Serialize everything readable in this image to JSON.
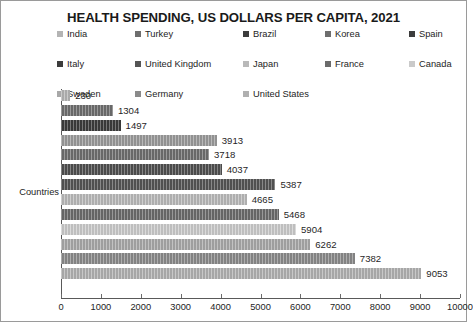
{
  "chart_data": {
    "type": "bar",
    "orientation": "horizontal",
    "title": "HEALTH SPENDING, US DOLLARS PER CAPITA, 2021",
    "xlabel": "",
    "ylabel": "Countries",
    "xlim": [
      0,
      10000
    ],
    "grid": false,
    "legend_position": "top",
    "xticks": [
      "0",
      "1000",
      "2000",
      "3000",
      "4000",
      "5000",
      "6000",
      "7000",
      "8000",
      "9000",
      "10000"
    ],
    "xtick_values": [
      0,
      1000,
      2000,
      3000,
      4000,
      5000,
      6000,
      7000,
      8000,
      9000,
      10000
    ],
    "categories": [
      "India",
      "Turkey",
      "Brazil",
      "Korea",
      "Spain",
      "Italy",
      "United Kingdom",
      "Japan",
      "France",
      "Canada",
      "Sweden",
      "Germany",
      "United States"
    ],
    "values": [
      230,
      1304,
      1497,
      3913,
      3718,
      4037,
      5387,
      4665,
      5468,
      5904,
      6262,
      7382,
      9053
    ],
    "bar_colors": [
      "#b4b4b4",
      "#6e6e6e",
      "#3c3c3c",
      "#9a9a9a",
      "#6e6e6e",
      "#4f4f4f",
      "#555555",
      "#b9b9b9",
      "#6b6b6b",
      "#cacaca",
      "#a8a8a8",
      "#8a8a8a",
      "#b0b0b0"
    ],
    "data_labels": [
      "230",
      "1304",
      "1497",
      "3913",
      "3718",
      "4037",
      "5387",
      "4665",
      "5468",
      "5904",
      "6262",
      "7382",
      "9053"
    ]
  },
  "legend": {
    "rows": [
      [
        {
          "label": "India",
          "color": "#b4b4b4"
        },
        {
          "label": "Turkey",
          "color": "#6e6e6e"
        },
        {
          "label": "Brazil",
          "color": "#3c3c3c"
        },
        {
          "label": "Korea",
          "color": "#6e6e6e"
        },
        {
          "label": "Spain",
          "color": "#3c3c3c"
        }
      ],
      [
        {
          "label": "Italy",
          "color": "#3c3c3c"
        },
        {
          "label": "United Kingdom",
          "color": "#555555"
        },
        {
          "label": "Japan",
          "color": "#b9b9b9"
        },
        {
          "label": "France",
          "color": "#6b6b6b"
        },
        {
          "label": "Canada",
          "color": "#cacaca"
        }
      ],
      [
        {
          "label": "Sweden",
          "color": "#a8a8a8"
        },
        {
          "label": "Germany",
          "color": "#8a8a8a"
        },
        {
          "label": "United States",
          "color": "#b0b0b0"
        }
      ]
    ],
    "column_offsets": [
      0,
      78,
      186,
      268,
      352
    ]
  }
}
